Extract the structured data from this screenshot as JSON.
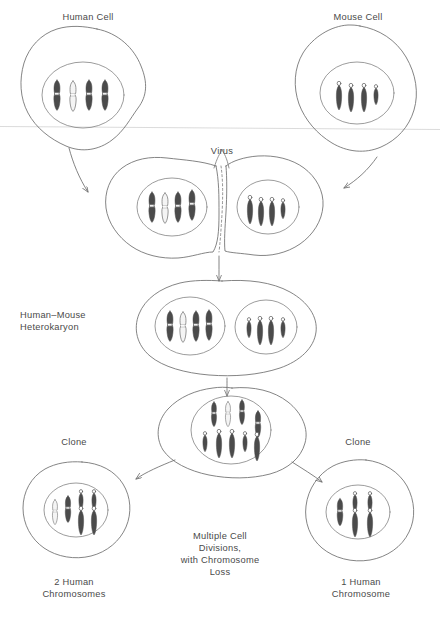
{
  "figure": {
    "stages": [
      {
        "id": "human-cell",
        "label": "Human Cell"
      },
      {
        "id": "mouse-cell",
        "label": "Mouse Cell"
      },
      {
        "id": "virus-fusion",
        "label": "Virus"
      },
      {
        "id": "heterokaryon",
        "label": "Human–Mouse\nHeterokaryon"
      },
      {
        "id": "hybrid-cell",
        "label": ""
      },
      {
        "id": "clone-left",
        "label": "Clone"
      },
      {
        "id": "clone-right",
        "label": "Clone"
      }
    ],
    "labels": {
      "human_cell": "Human Cell",
      "mouse_cell": "Mouse Cell",
      "virus": "Virus",
      "heterokaryon_line1": "Human–Mouse",
      "heterokaryon_line2": "Heterokaryon",
      "clone_left": "Clone",
      "clone_right": "Clone",
      "divisions_line1": "Multiple Cell",
      "divisions_line2": "Divisions,",
      "divisions_line3": "with Chromosome",
      "divisions_line4": "Loss",
      "result_left_line1": "2 Human",
      "result_left_line2": "Chromosomes",
      "result_right_line1": "1 Human",
      "result_right_line2": "Chromosome"
    },
    "chromosome_counts": {
      "human_cell_human": 4,
      "mouse_cell_mouse": 4,
      "fusion_left_human": 4,
      "fusion_right_mouse": 4,
      "heterokaryon_human": 4,
      "heterokaryon_mouse": 4,
      "hybrid_human": 4,
      "hybrid_mouse": 5,
      "clone_left_human": 2,
      "clone_left_mouse": 4,
      "clone_right_human": 1,
      "clone_right_mouse": 4
    },
    "colors": {
      "outline": "#6e6e6e",
      "nucleus_outline": "#8a8a8a",
      "chromosome_dark": "#4b4b4b",
      "chromosome_light": "#f2f2f2",
      "chromosome_stroke": "#5a5a5a",
      "text": "#4a4a4a",
      "background": "#ffffff",
      "scan_line": "#cfcfcf"
    }
  }
}
